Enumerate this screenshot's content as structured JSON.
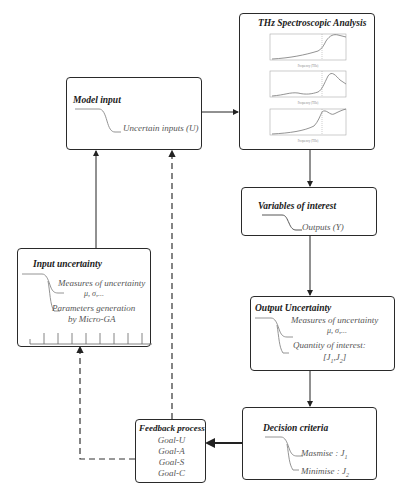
{
  "diagram": {
    "thz_box": {
      "title": "THz  Spectroscopic Analysis",
      "plots": [
        {
          "title": "Sample",
          "xlabel": "Frequency (THz)",
          "caption": "Sub-label"
        },
        {
          "title": "",
          "xlabel": "Frequency (THz)",
          "caption": "Sub-label"
        },
        {
          "title": "",
          "xlabel": "Frequency (THz)",
          "caption": ""
        }
      ]
    },
    "model_input": {
      "title": "Model input",
      "item": "Uncertain inputs (U)"
    },
    "variables_of_interest": {
      "title": "Variables of interest",
      "item": "Outputs (Y)"
    },
    "input_uncertainty": {
      "title": "Input uncertainty",
      "item1_line1": "Measures of uncertainty",
      "item1_line2": "μ, σ,...",
      "item2_line1": "Parameters generation",
      "item2_line2": "by Micro-GA"
    },
    "output_uncertainty": {
      "title": "Output Uncertainty",
      "item1_line1": "Measures of uncertainty",
      "item1_line2": "μ, σ,...",
      "item2_line1": "Quantity of interest:",
      "item2_line2": "[J1,J2]"
    },
    "decision_criteria": {
      "title": "Decision criteria",
      "item1": "Masmise : J1",
      "item2": "Minimise : J2"
    },
    "feedback_process": {
      "title": "Feedback process",
      "goals": [
        "Goal-U",
        "Goal-A",
        "Goal-S",
        "Goal-C"
      ]
    }
  }
}
